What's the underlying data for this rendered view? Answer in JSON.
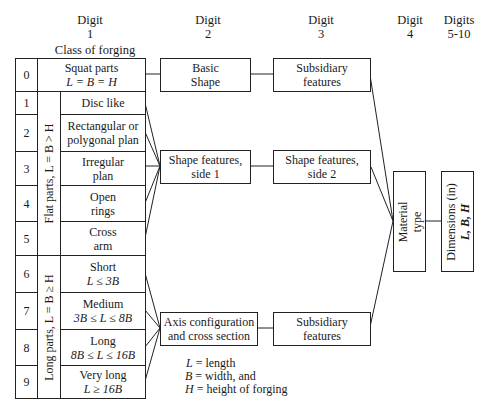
{
  "headers": {
    "digit1": {
      "line1": "Digit",
      "line2": "1"
    },
    "digit2": {
      "line1": "Digit",
      "line2": "2"
    },
    "digit3": {
      "line1": "Digit",
      "line2": "3"
    },
    "digit4": {
      "line1": "Digit",
      "line2": "4"
    },
    "digits5_10": {
      "line1": "Digits",
      "line2": "5-10"
    },
    "class_title": "Class of forging"
  },
  "table": {
    "rows": [
      {
        "digit": "0",
        "label": "Squat parts",
        "sub": "L = B = H"
      },
      {
        "digit": "1",
        "label": "Disc like",
        "sub": ""
      },
      {
        "digit": "2",
        "label": "Rectangular or",
        "sub": "polygonal plan"
      },
      {
        "digit": "3",
        "label": "Irregular",
        "sub": "plan"
      },
      {
        "digit": "4",
        "label": "Open",
        "sub": "rings"
      },
      {
        "digit": "5",
        "label": "Cross",
        "sub": "arm"
      },
      {
        "digit": "6",
        "label": "Short",
        "sub": "L ≤ 3B"
      },
      {
        "digit": "7",
        "label": "Medium",
        "sub": "3B ≤ L ≤ 8B"
      },
      {
        "digit": "8",
        "label": "Long",
        "sub": "8B ≤ L ≤ 16B"
      },
      {
        "digit": "9",
        "label": "Very long",
        "sub": "L ≥ 16B"
      }
    ],
    "group_flat": "Flat parts, L = B > H",
    "group_long": "Long parts, L = B ≥ H"
  },
  "boxes": {
    "basic_shape": {
      "line1": "Basic",
      "line2": "Shape"
    },
    "subsidiary_top": {
      "line1": "Subsidiary",
      "line2": "features"
    },
    "shape_side1": {
      "line1": "Shape features,",
      "line2": "side 1"
    },
    "shape_side2": {
      "line1": "Shape features,",
      "line2": "side 2"
    },
    "axis_config": {
      "line1": "Axis configuration",
      "line2": "and cross section"
    },
    "subsidiary_bottom": {
      "line1": "Subsidiary",
      "line2": "features"
    },
    "material_type": {
      "line1": "Material",
      "line2": "type"
    },
    "dimensions": {
      "line1": "Dimensions (in)",
      "line2": "L, B, H"
    }
  },
  "legend": {
    "l": {
      "sym": "L",
      "text": " = length"
    },
    "b": {
      "sym": "B",
      "text": " = width, and"
    },
    "h": {
      "sym": "H",
      "text": " = height of forging"
    }
  }
}
